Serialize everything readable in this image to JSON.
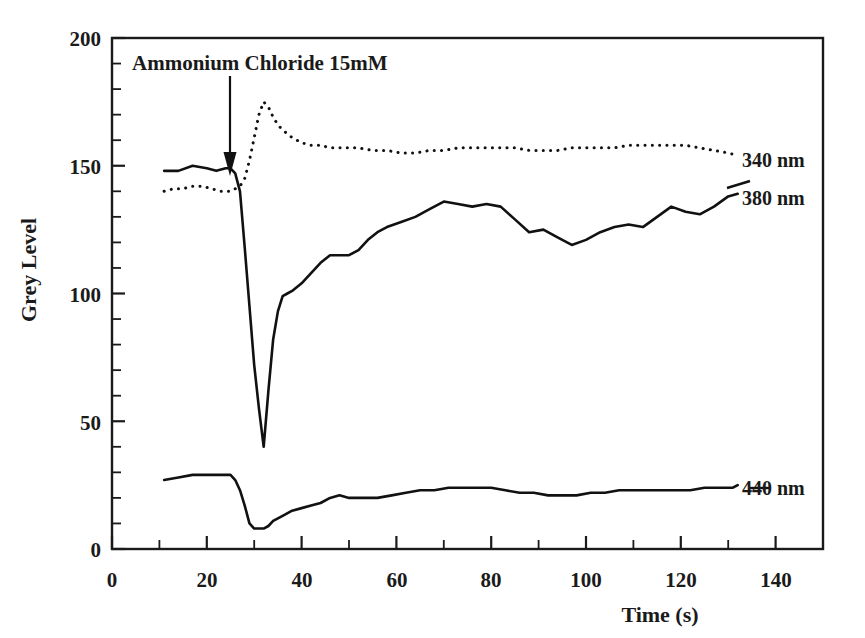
{
  "figure": {
    "background_color": "#ffffff",
    "ink_color": "#1a1a1a"
  },
  "annotation": {
    "text": "Ammonium Chloride 15mM",
    "arrow_name": "down-arrow-icon",
    "points_at_time": 26
  },
  "axes": {
    "x_title": "Time (s)",
    "y_title": "Grey Level",
    "x_ticks": [
      "0",
      "20",
      "40",
      "60",
      "80",
      "100",
      "120",
      "140"
    ],
    "y_ticks": [
      "0",
      "50",
      "100",
      "150",
      "200"
    ]
  },
  "series_labels": [
    {
      "name": "340 nm",
      "style": "dotted"
    },
    {
      "name": "380 nm",
      "style": "solid"
    },
    {
      "name": "440 nm",
      "style": "solid"
    }
  ],
  "chart_data": {
    "type": "line",
    "title": "",
    "xlabel": "Time (s)",
    "ylabel": "Grey Level",
    "xlim": [
      0,
      150
    ],
    "ylim": [
      0,
      200
    ],
    "x_ticks": [
      0,
      20,
      40,
      60,
      80,
      100,
      120,
      140
    ],
    "y_ticks": [
      0,
      50,
      100,
      150,
      200
    ],
    "x_minor_tick_step": 10,
    "y_minor_tick_step": 10,
    "grid": false,
    "legend": "inline-right-labels",
    "annotations": [
      {
        "text": "Ammonium Chloride 15mM",
        "x": 26,
        "y": 190,
        "arrow_to_x": 26,
        "arrow_to_y": 152
      }
    ],
    "series": [
      {
        "name": "340 nm",
        "style": "dotted",
        "color": "#111111",
        "x": [
          11,
          13,
          15,
          17,
          19,
          21,
          23,
          25,
          26,
          27,
          28,
          29,
          30,
          31,
          32,
          33,
          34,
          35,
          36,
          38,
          40,
          42,
          44,
          46,
          48,
          50,
          52,
          55,
          58,
          61,
          64,
          67,
          70,
          73,
          76,
          79,
          82,
          85,
          88,
          91,
          94,
          97,
          100,
          103,
          106,
          109,
          112,
          115,
          118,
          121,
          124,
          127,
          130,
          132
        ],
        "y": [
          140,
          141,
          141,
          142,
          142,
          141,
          140,
          140,
          141,
          142,
          145,
          152,
          161,
          170,
          175,
          173,
          169,
          166,
          164,
          161,
          159,
          158,
          158,
          157,
          157,
          157,
          157,
          156,
          156,
          155,
          155,
          156,
          156,
          157,
          157,
          157,
          157,
          157,
          156,
          156,
          156,
          157,
          157,
          157,
          157,
          158,
          158,
          158,
          158,
          158,
          157,
          156,
          155,
          154
        ]
      },
      {
        "name": "380 nm",
        "style": "solid",
        "color": "#111111",
        "x": [
          11,
          14,
          17,
          20,
          22,
          24,
          25,
          26,
          27,
          28,
          29,
          30,
          31,
          32,
          33,
          34,
          35,
          36,
          37,
          38,
          40,
          42,
          44,
          46,
          48,
          50,
          52,
          54,
          56,
          58,
          61,
          64,
          67,
          70,
          73,
          76,
          79,
          82,
          85,
          88,
          91,
          94,
          97,
          100,
          103,
          106,
          109,
          112,
          115,
          118,
          121,
          124,
          127,
          130,
          132
        ],
        "y": [
          148,
          148,
          150,
          149,
          148,
          149,
          149,
          147,
          140,
          118,
          95,
          72,
          55,
          40,
          62,
          82,
          93,
          99,
          100,
          101,
          104,
          108,
          112,
          115,
          115,
          115,
          117,
          121,
          124,
          126,
          128,
          130,
          133,
          136,
          135,
          134,
          135,
          134,
          129,
          124,
          125,
          122,
          119,
          121,
          124,
          126,
          127,
          126,
          130,
          134,
          132,
          131,
          134,
          138,
          139
        ]
      },
      {
        "name": "440 nm",
        "style": "solid",
        "color": "#111111",
        "x": [
          11,
          14,
          17,
          20,
          23,
          25,
          26,
          27,
          28,
          29,
          30,
          31,
          32,
          33,
          34,
          36,
          38,
          40,
          42,
          44,
          46,
          48,
          50,
          53,
          56,
          59,
          62,
          65,
          68,
          71,
          74,
          77,
          80,
          83,
          86,
          89,
          92,
          95,
          98,
          101,
          104,
          107,
          110,
          113,
          116,
          119,
          122,
          125,
          128,
          131,
          132
        ],
        "y": [
          27,
          28,
          29,
          29,
          29,
          29,
          27,
          23,
          17,
          10,
          8,
          8,
          8,
          9,
          11,
          13,
          15,
          16,
          17,
          18,
          20,
          21,
          20,
          20,
          20,
          21,
          22,
          23,
          23,
          24,
          24,
          24,
          24,
          23,
          22,
          22,
          21,
          21,
          21,
          22,
          22,
          23,
          23,
          23,
          23,
          23,
          23,
          24,
          24,
          24,
          25
        ]
      }
    ]
  }
}
